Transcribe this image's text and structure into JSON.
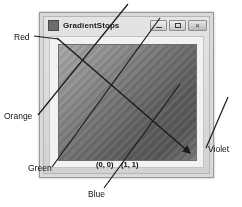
{
  "figure": {
    "kind": "screenshot-figure"
  },
  "window": {
    "title": "GradientStops",
    "icon": "app-icon",
    "buttons": [
      {
        "name": "minimize",
        "label": "–",
        "glyph": "minimize-glyph"
      },
      {
        "name": "maximize",
        "label": "□",
        "glyph": "maximize-glyph"
      },
      {
        "name": "close",
        "label": "✕",
        "glyph": "close-glyph"
      }
    ]
  },
  "gradient": {
    "name": "diagonal-linear-gradient",
    "direction": "top-left to bottom-right",
    "start_point_label": "(0, 0)",
    "end_point_label": "(1, 1)"
  },
  "annotations": [
    {
      "id": "red",
      "label": "Red"
    },
    {
      "id": "orange",
      "label": "Orange"
    },
    {
      "id": "green",
      "label": "Green"
    },
    {
      "id": "blue",
      "label": "Blue"
    },
    {
      "id": "violet",
      "label": "Violet"
    }
  ],
  "colors": {
    "page_background": "#ffffff",
    "window_chrome": "#d9d9d9",
    "client_area": "#f2f2f2",
    "leader_line": "#1a1a1a",
    "text": "#111111"
  }
}
